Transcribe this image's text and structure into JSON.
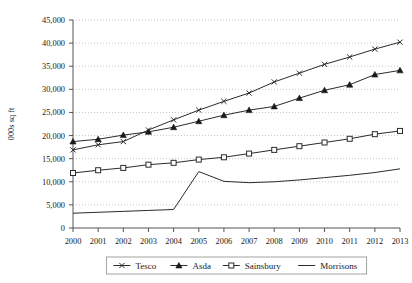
{
  "chart_data": {
    "type": "line",
    "title": "",
    "xlabel": "",
    "ylabel": "000s sq ft",
    "x": [
      2000,
      2001,
      2002,
      2003,
      2004,
      2005,
      2006,
      2007,
      2008,
      2009,
      2010,
      2011,
      2012,
      2013
    ],
    "categories": [
      "2000",
      "2001",
      "2002",
      "2003",
      "2004",
      "2005",
      "2006",
      "2007",
      "2008",
      "2009",
      "2010",
      "2011",
      "2012",
      "2013"
    ],
    "ylim": [
      0,
      45000
    ],
    "xlim": [
      2000,
      2013
    ],
    "ytick_labels": [
      "0",
      "5,000",
      "10,000",
      "15,000",
      "20,000",
      "25,000",
      "30,000",
      "35,000",
      "40,000",
      "45,000"
    ],
    "ytick_values": [
      0,
      5000,
      10000,
      15000,
      20000,
      25000,
      30000,
      35000,
      40000,
      45000
    ],
    "grid": "horizontal-dotted",
    "legend_position": "bottom",
    "series": [
      {
        "name": "Tesco",
        "marker": "x",
        "values": [
          16900,
          18000,
          18700,
          21200,
          23400,
          25500,
          27400,
          29200,
          31600,
          33500,
          35400,
          37000,
          38700,
          40200
        ]
      },
      {
        "name": "Asda",
        "marker": "triangle",
        "values": [
          18700,
          19200,
          20100,
          20800,
          21800,
          23100,
          24400,
          25500,
          26300,
          28100,
          29800,
          31000,
          33200,
          34100
        ]
      },
      {
        "name": "Sainsbury",
        "marker": "square",
        "values": [
          11900,
          12500,
          13000,
          13700,
          14100,
          14800,
          15300,
          16100,
          16900,
          17700,
          18500,
          19300,
          20300,
          21000
        ]
      },
      {
        "name": "Morrisons",
        "marker": "none",
        "values": [
          3200,
          3400,
          3600,
          3800,
          4000,
          12200,
          10100,
          9800,
          10000,
          10400,
          10900,
          11400,
          12000,
          12800
        ]
      }
    ]
  },
  "legend": {
    "items": [
      {
        "label": "Tesco",
        "marker": "x"
      },
      {
        "label": "Asda",
        "marker": "triangle"
      },
      {
        "label": "Sainsbury",
        "marker": "square"
      },
      {
        "label": "Morrisons",
        "marker": "none"
      }
    ]
  }
}
